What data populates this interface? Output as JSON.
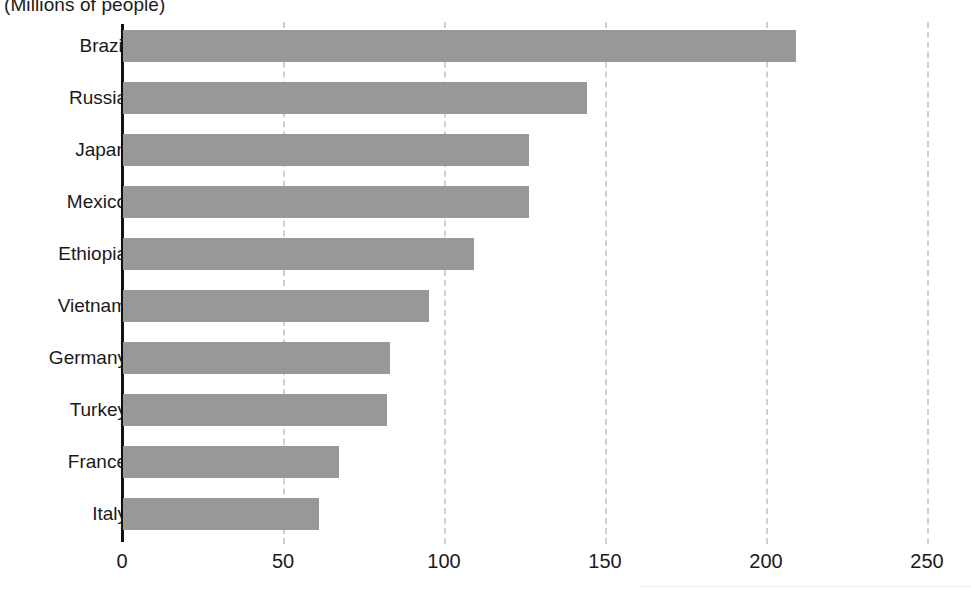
{
  "chart_data": {
    "type": "bar",
    "orientation": "horizontal",
    "title": "(Millions of people)",
    "xlabel": "",
    "ylabel": "",
    "categories": [
      "Brazil",
      "Russia",
      "Japan",
      "Mexico",
      "Ethiopia",
      "Vietnam",
      "Germany",
      "Turkey",
      "France",
      "Italy"
    ],
    "values": [
      209,
      144,
      126,
      126,
      109,
      95,
      83,
      82,
      67,
      61
    ],
    "xlim": [
      0,
      250
    ],
    "xticks": [
      0,
      50,
      100,
      150,
      200,
      250
    ],
    "xticklabels": [
      "0",
      "50",
      "100",
      "150",
      "200",
      "250"
    ],
    "grid": "vertical-dashed",
    "legend": "none",
    "bar_color": "#989898",
    "axis_color": "#111111",
    "gridline_color": "#cfcfcf"
  }
}
